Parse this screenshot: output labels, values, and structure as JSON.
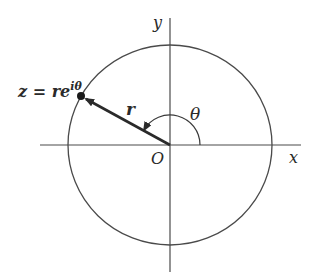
{
  "diagram": {
    "labels": {
      "y_axis": "y",
      "x_axis": "x",
      "origin": "O",
      "radius": "r",
      "angle": "θ",
      "point_base": "z = re",
      "point_exponent": "iθ"
    },
    "geometry": {
      "center": [
        170,
        145
      ],
      "circle_radius": 102,
      "point": [
        81,
        96
      ],
      "angle_arc_radius": 30,
      "angle_degrees": 151
    },
    "colors": {
      "stroke": "#3a3a3a",
      "text": "#2a2a2a",
      "background": "#ffffff"
    }
  }
}
